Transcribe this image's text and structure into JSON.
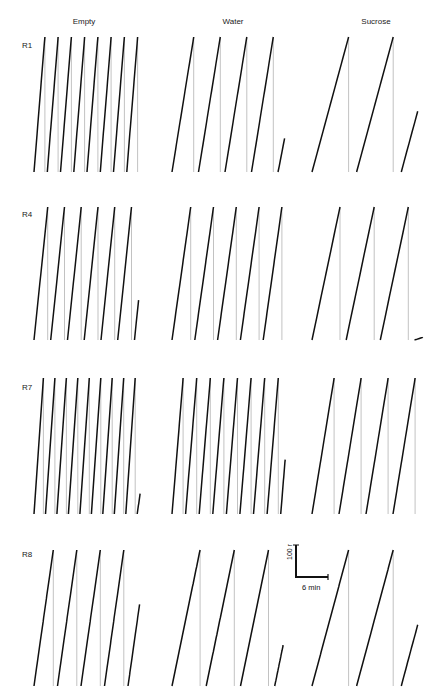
{
  "chart_data": {
    "type": "line",
    "title": "",
    "columns": [
      "Empty",
      "Water",
      "Sucrose"
    ],
    "rows": [
      "R1",
      "R4",
      "R7",
      "R8"
    ],
    "scale_bar": {
      "y_label": "100 r",
      "x_label": "6 min"
    },
    "panels": [
      {
        "row": "R1",
        "col": "Empty",
        "resets": 8,
        "steps_per_sweep": 3,
        "final_partial": 1.0
      },
      {
        "row": "R1",
        "col": "Water",
        "resets": 4,
        "steps_per_sweep": 5,
        "final_partial": 0.25
      },
      {
        "row": "R1",
        "col": "Sucrose",
        "resets": 2,
        "steps_per_sweep": 6,
        "final_partial": 0.45
      },
      {
        "row": "R4",
        "col": "Empty",
        "resets": 6,
        "steps_per_sweep": 2,
        "final_partial": 0.3
      },
      {
        "row": "R4",
        "col": "Water",
        "resets": 5,
        "steps_per_sweep": 5,
        "final_partial": 1.0
      },
      {
        "row": "R4",
        "col": "Sucrose",
        "resets": 3,
        "steps_per_sweep": 6,
        "final_partial": 0.02
      },
      {
        "row": "R7",
        "col": "Empty",
        "resets": 9,
        "steps_per_sweep": 2,
        "final_partial": 0.15
      },
      {
        "row": "R7",
        "col": "Water",
        "resets": 8,
        "steps_per_sweep": 3,
        "final_partial": 0.4
      },
      {
        "row": "R7",
        "col": "Sucrose",
        "resets": 4,
        "steps_per_sweep": 5,
        "final_partial": 1.0
      },
      {
        "row": "R8",
        "col": "Empty",
        "resets": 4,
        "steps_per_sweep": 6,
        "final_partial": 0.6
      },
      {
        "row": "R8",
        "col": "Water",
        "resets": 3,
        "steps_per_sweep": 8,
        "final_partial": 0.3
      },
      {
        "row": "R8",
        "col": "Sucrose",
        "resets": 2,
        "steps_per_sweep": 8,
        "final_partial": 0.45
      }
    ]
  },
  "labels": {
    "col_empty": "Empty",
    "col_water": "Water",
    "col_sucrose": "Sucrose",
    "row_r1": "R1",
    "row_r4": "R4",
    "row_r7": "R7",
    "row_r8": "R8",
    "scale_y": "100 r",
    "scale_x": "6 min"
  }
}
